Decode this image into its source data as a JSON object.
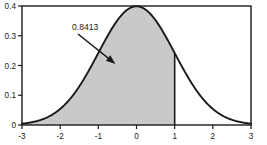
{
  "chart_data": {
    "type": "area",
    "title": "",
    "xlabel": "",
    "ylabel": "",
    "xlim": [
      -3,
      3
    ],
    "ylim": [
      0,
      0.4
    ],
    "grid": false,
    "legend_position": "none",
    "curve": {
      "name": "standard normal pdf",
      "formula": "phi(x) = exp(-x^2/2)/sqrt(2*pi)",
      "line_color": "#1a1a1a",
      "x": [
        -3,
        -2.8,
        -2.6,
        -2.4,
        -2.2,
        -2,
        -1.8,
        -1.6,
        -1.4,
        -1.2,
        -1,
        -0.8,
        -0.6,
        -0.4,
        -0.2,
        0,
        0.2,
        0.4,
        0.6,
        0.8,
        1,
        1.2,
        1.4,
        1.6,
        1.8,
        2,
        2.2,
        2.4,
        2.6,
        2.8,
        3
      ],
      "y": [
        0.0044,
        0.0079,
        0.0136,
        0.0224,
        0.0355,
        0.054,
        0.079,
        0.1109,
        0.1497,
        0.1942,
        0.242,
        0.2897,
        0.3332,
        0.3683,
        0.391,
        0.3989,
        0.391,
        0.3683,
        0.3332,
        0.2897,
        0.242,
        0.1942,
        0.1497,
        0.1109,
        0.079,
        0.054,
        0.0355,
        0.0224,
        0.0136,
        0.0079,
        0.0044
      ]
    },
    "shaded_region": {
      "from": -3,
      "to": 1,
      "area_value": 0.8413,
      "fill_color": "#c9c9c9",
      "boundary_line_x": 1
    },
    "annotation": {
      "text": "0.8413",
      "points_to_x": -0.55,
      "points_to_y": 0.205
    },
    "x_ticks": [
      {
        "value": -3,
        "label": "-3"
      },
      {
        "value": -2,
        "label": "-2"
      },
      {
        "value": -1,
        "label": "-1"
      },
      {
        "value": 0,
        "label": "0"
      },
      {
        "value": 1,
        "label": "1"
      },
      {
        "value": 2,
        "label": "2"
      },
      {
        "value": 3,
        "label": "3"
      }
    ],
    "y_ticks": [
      {
        "value": 0,
        "label": "0"
      },
      {
        "value": 0.1,
        "label": "0.1"
      },
      {
        "value": 0.2,
        "label": "0.2"
      },
      {
        "value": 0.3,
        "label": "0.3"
      },
      {
        "value": 0.4,
        "label": "0.4"
      }
    ]
  }
}
